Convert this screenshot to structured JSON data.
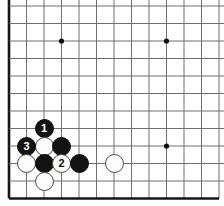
{
  "board": {
    "kind": "go-board-diagram",
    "title": "Go board corner diagram",
    "size": 19,
    "visible_columns": 13,
    "visible_rows": 12,
    "background_color": "#ffffff",
    "grid_line_color": "#6f6f6f",
    "edge_line_color": "#161616",
    "star_point_color": "#111111",
    "black_stone_color": "#131313",
    "white_stone_color": "#fdfdfd",
    "white_stone_border_color": "#4a4a4a",
    "geometry": {
      "origin_x": 9,
      "origin_y": 6,
      "spacing": 17.5,
      "stone_diameter": 19,
      "star_point_radius": 2.6
    },
    "edges": [
      "left",
      "bottom"
    ],
    "star_points": [
      {
        "name": "star-point-upper-left",
        "col": 4,
        "row": 3
      },
      {
        "name": "star-point-upper-right",
        "col": 10,
        "row": 3
      },
      {
        "name": "star-point-lower-right",
        "col": 10,
        "row": 9
      }
    ],
    "stones": [
      {
        "name": "black-stone-move-1",
        "color": "black",
        "col": 3,
        "row": 8,
        "label": "1"
      },
      {
        "name": "white-stone-unnumbered-a",
        "color": "white",
        "col": 3,
        "row": 9,
        "label": ""
      },
      {
        "name": "black-stone-unnumbered-a",
        "color": "black",
        "col": 4,
        "row": 9,
        "label": ""
      },
      {
        "name": "black-stone-move-3",
        "color": "black",
        "col": 2,
        "row": 9,
        "label": "3"
      },
      {
        "name": "white-stone-unnumbered-b",
        "color": "white",
        "col": 2,
        "row": 10,
        "label": ""
      },
      {
        "name": "black-stone-unnumbered-b",
        "color": "black",
        "col": 3,
        "row": 10,
        "label": ""
      },
      {
        "name": "white-stone-move-2",
        "color": "white",
        "col": 4,
        "row": 10,
        "label": "2"
      },
      {
        "name": "black-stone-unnumbered-c",
        "color": "black",
        "col": 5,
        "row": 10,
        "label": ""
      },
      {
        "name": "white-stone-unnumbered-c",
        "color": "white",
        "col": 3,
        "row": 11,
        "label": ""
      },
      {
        "name": "white-stone-unnumbered-d",
        "color": "white",
        "col": 7,
        "row": 10,
        "label": ""
      }
    ],
    "move_labels": [
      "1",
      "2",
      "3"
    ]
  }
}
